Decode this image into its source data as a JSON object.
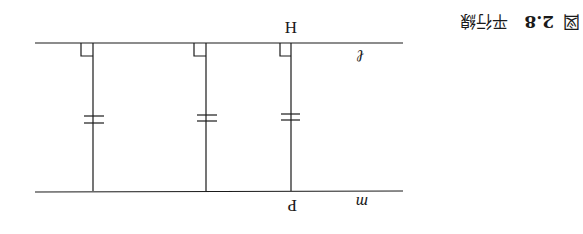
{
  "figure": {
    "orientation": "rotated-180",
    "caption": {
      "prefix": "図",
      "number": "2.8",
      "title": "平行線"
    },
    "lines": [
      {
        "name": "l",
        "label": "ℓ"
      },
      {
        "name": "m",
        "label": "m"
      }
    ],
    "points": [
      {
        "name": "H",
        "label": "H"
      },
      {
        "name": "P",
        "label": "P"
      }
    ],
    "perpendiculars": 3,
    "equal_length_marks": "=",
    "colors": {
      "ink": "#1a1a1a",
      "background": "#ffffff"
    }
  }
}
